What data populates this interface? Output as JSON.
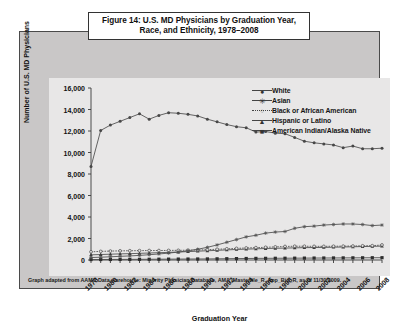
{
  "figure": {
    "title_line1": "Figure 14: U.S. MD Physicians by Graduation Year,",
    "title_line2": "Race, and Ethnicity, 1978–2008",
    "footnote": "Graph adapted from AAMC Data warehouse: Minority Physician Database, AMA_Masterfile_R, App_Bio_R, as of 11/30/2009.",
    "panel_color": "#c9c7c7",
    "plot_color": "#e8e7e7",
    "line_color": "#4a4a4a",
    "border_color": "#4a4a4a"
  },
  "legend": {
    "position": "top-right",
    "items": [
      {
        "label": "White",
        "marker": "circle"
      },
      {
        "label": "Asian",
        "marker": "asterisk"
      },
      {
        "label": "Black or African American",
        "marker": "open-circle-dotted"
      },
      {
        "label": "Hispanic or Latino",
        "marker": "triangle"
      },
      {
        "label": "American Indian/Alaska Native",
        "marker": "square"
      }
    ]
  },
  "chart_data": {
    "type": "line",
    "title": "Figure 14: U.S. MD Physicians by Graduation Year, Race, and Ethnicity, 1978–2008",
    "xlabel": "Graduation Year",
    "ylabel": "Number of U.S. MD Physicians",
    "xlim": [
      1978,
      2008
    ],
    "ylim": [
      0,
      16000
    ],
    "yticks": [
      0,
      2000,
      4000,
      6000,
      8000,
      10000,
      12000,
      14000,
      16000
    ],
    "ytick_labels": [
      "0",
      "2,000",
      "4,000",
      "6,000",
      "8,000",
      "10,000",
      "12,000",
      "14,000",
      "16,000"
    ],
    "x": [
      1978,
      1979,
      1980,
      1981,
      1982,
      1983,
      1984,
      1985,
      1986,
      1987,
      1988,
      1989,
      1990,
      1991,
      1992,
      1993,
      1994,
      1995,
      1996,
      1997,
      1998,
      1999,
      2000,
      2001,
      2002,
      2003,
      2004,
      2005,
      2006,
      2007,
      2008
    ],
    "xtick_labels": [
      "1978",
      "1980",
      "1982",
      "1984",
      "1986",
      "1988",
      "1990",
      "1992",
      "1994",
      "1996",
      "1998",
      "2000",
      "2002",
      "2004",
      "2006",
      "2008"
    ],
    "xtick_values": [
      1978,
      1980,
      1982,
      1984,
      1986,
      1988,
      1990,
      1992,
      1994,
      1996,
      1998,
      2000,
      2002,
      2004,
      2006,
      2008
    ],
    "grid": false,
    "legend_position": "upper right",
    "series": [
      {
        "name": "White",
        "marker": "circle",
        "values": [
          8700,
          12050,
          12550,
          12900,
          13250,
          13600,
          13100,
          13450,
          13700,
          13650,
          13550,
          13400,
          13100,
          12850,
          12600,
          12400,
          12300,
          11900,
          11950,
          11800,
          11750,
          11400,
          11050,
          10900,
          10800,
          10700,
          10450,
          10600,
          10350,
          10350,
          10400
        ]
      },
      {
        "name": "Asian",
        "marker": "asterisk",
        "values": [
          230,
          260,
          300,
          340,
          380,
          430,
          490,
          560,
          640,
          740,
          860,
          1000,
          1180,
          1400,
          1650,
          1900,
          2150,
          2300,
          2500,
          2600,
          2650,
          2950,
          3100,
          3150,
          3250,
          3300,
          3350,
          3350,
          3300,
          3200,
          3250
        ]
      },
      {
        "name": "Black or African American",
        "marker": "open-circle-dotted",
        "values": [
          760,
          800,
          830,
          850,
          860,
          870,
          880,
          880,
          890,
          900,
          910,
          930,
          960,
          1000,
          1040,
          1080,
          1120,
          1150,
          1180,
          1220,
          1260,
          1280,
          1280,
          1270,
          1270,
          1280,
          1290,
          1300,
          1320,
          1330,
          1400
        ]
      },
      {
        "name": "Hispanic or Latino",
        "marker": "triangle",
        "values": [
          480,
          510,
          540,
          570,
          590,
          620,
          650,
          680,
          710,
          740,
          780,
          820,
          860,
          900,
          940,
          980,
          1010,
          1040,
          1070,
          1090,
          1110,
          1130,
          1150,
          1160,
          1170,
          1190,
          1210,
          1230,
          1250,
          1270,
          1290
        ]
      },
      {
        "name": "American Indian/Alaska Native",
        "marker": "square",
        "values": [
          40,
          45,
          50,
          55,
          60,
          65,
          70,
          75,
          80,
          85,
          90,
          95,
          100,
          110,
          120,
          130,
          140,
          150,
          155,
          160,
          165,
          170,
          175,
          180,
          185,
          190,
          195,
          200,
          205,
          210,
          215
        ]
      }
    ]
  }
}
